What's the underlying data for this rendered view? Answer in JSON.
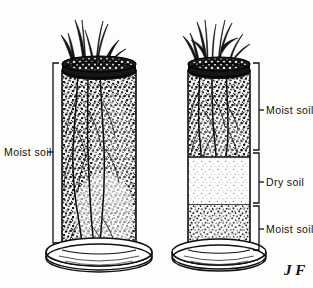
{
  "figure": {
    "background_color": "#fdfdfb",
    "ink_color": "#111111",
    "signature": "J F"
  },
  "labels": {
    "left_column": "Moist soil",
    "right_top": "Moist soil",
    "right_middle": "Dry soil",
    "right_bottom": "Moist soil"
  },
  "columns": [
    {
      "id": "left-column",
      "name": "continuously-moist-column",
      "plants": 3,
      "layers": [
        {
          "name": "moist-soil",
          "type": "moist",
          "top": 70,
          "bottom": 250
        }
      ],
      "brackets": [
        {
          "label": "Moist soil",
          "top": 63,
          "bottom": 243
        }
      ]
    },
    {
      "id": "right-column",
      "name": "layered-dry-band-column",
      "plants": 3,
      "layers": [
        {
          "name": "moist-soil-upper",
          "type": "moist",
          "top": 70,
          "bottom": 157
        },
        {
          "name": "dry-soil-band",
          "type": "dry",
          "top": 157,
          "bottom": 205
        },
        {
          "name": "moist-soil-lower",
          "type": "moist",
          "top": 205,
          "bottom": 250
        }
      ],
      "brackets": [
        {
          "label": "Moist soil",
          "top": 63,
          "bottom": 150
        },
        {
          "label": "Dry soil",
          "top": 153,
          "bottom": 203
        },
        {
          "label": "Moist soil",
          "top": 206,
          "bottom": 250
        }
      ]
    }
  ]
}
